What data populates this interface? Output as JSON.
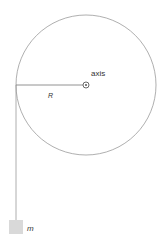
{
  "diagram": {
    "labels": {
      "axis": "axis",
      "radius": "R",
      "mass": "m"
    },
    "colors": {
      "line": "#9a9a9a",
      "mass_fill": "#d9d9d9",
      "text": "#333333"
    }
  }
}
